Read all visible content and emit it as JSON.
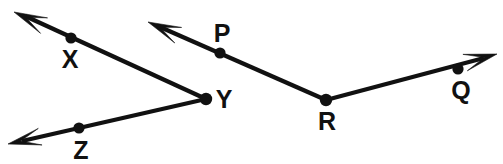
{
  "diagram": {
    "background_color": "#ffffff",
    "stroke_color": "#111111",
    "line_width": 4.2,
    "label_font_size": 25,
    "vertices": [
      {
        "id": "Y",
        "label": "Y",
        "role": "angle-vertex",
        "x": 206,
        "y": 99,
        "dot_radius": 6.2,
        "label_x": 224,
        "label_y": 108
      },
      {
        "id": "R",
        "label": "R",
        "role": "angle-vertex",
        "x": 326,
        "y": 100,
        "dot_radius": 6.2,
        "label_x": 327,
        "label_y": 130
      }
    ],
    "marked_points": [
      {
        "id": "X",
        "label": "X",
        "role": "ray-point",
        "x": 71,
        "y": 38,
        "dot_radius": 5.6,
        "label_x": 70,
        "label_y": 68
      },
      {
        "id": "Z",
        "label": "Z",
        "role": "ray-point",
        "x": 79,
        "y": 128,
        "dot_radius": 5.6,
        "label_x": 81,
        "label_y": 159
      },
      {
        "id": "P",
        "label": "P",
        "role": "ray-point",
        "x": 220,
        "y": 53,
        "dot_radius": 5.6,
        "label_x": 222,
        "label_y": 42
      },
      {
        "id": "Q",
        "label": "Q",
        "role": "ray-point",
        "x": 458,
        "y": 69,
        "dot_radius": 5.6,
        "label_x": 461,
        "label_y": 99
      }
    ],
    "rays": [
      {
        "id": "ray-YX",
        "name": "ray-y-to-x",
        "from": "Y",
        "through": "X",
        "start_x": 206,
        "start_y": 99,
        "end_x": 25,
        "end_y": 16,
        "tip_x": 14,
        "tip_y": 12,
        "arrow": true
      },
      {
        "id": "ray-YZ",
        "name": "ray-y-to-z",
        "from": "Y",
        "through": "Z",
        "start_x": 206,
        "start_y": 99,
        "end_x": 22,
        "end_y": 141,
        "tip_x": 8,
        "tip_y": 144,
        "arrow": true
      },
      {
        "id": "ray-RP",
        "name": "ray-r-to-p",
        "from": "R",
        "through": "P",
        "start_x": 326,
        "start_y": 100,
        "end_x": 160,
        "end_y": 27,
        "tip_x": 148,
        "tip_y": 22,
        "arrow": true
      },
      {
        "id": "ray-RQ",
        "name": "ray-r-to-q",
        "from": "R",
        "through": "Q",
        "start_x": 326,
        "start_y": 100,
        "end_x": 484,
        "end_y": 58,
        "tip_x": 497,
        "tip_y": 54,
        "arrow": true
      }
    ],
    "angles": [
      {
        "id": "angle-XYZ",
        "name": "angle-xyz",
        "vertex": "Y",
        "arms": [
          "X",
          "Z"
        ],
        "notation": "XYZ"
      },
      {
        "id": "angle-PRQ",
        "name": "angle-prq",
        "vertex": "R",
        "arms": [
          "P",
          "Q"
        ],
        "notation": "PRQ"
      }
    ]
  }
}
